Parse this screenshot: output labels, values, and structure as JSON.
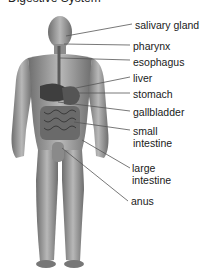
{
  "title": "Digestive System",
  "labels": [
    {
      "text": "salivary gland",
      "x": 135,
      "y": 19
    },
    {
      "text": "pharynx",
      "x": 133,
      "y": 40
    },
    {
      "text": "esophagus",
      "x": 133,
      "y": 56
    },
    {
      "text": "liver",
      "x": 133,
      "y": 73
    },
    {
      "text": "stomach",
      "x": 133,
      "y": 89
    },
    {
      "text": "gallbladder",
      "x": 133,
      "y": 107
    },
    {
      "text": "small",
      "x": 133,
      "y": 126
    },
    {
      "text": "intestine",
      "x": 133,
      "y": 138
    },
    {
      "text": "large",
      "x": 132,
      "y": 163
    },
    {
      "text": "intestine",
      "x": 132,
      "y": 175
    },
    {
      "text": "anus",
      "x": 131,
      "y": 196
    }
  ],
  "colors": {
    "skin": "#9a9a9a",
    "organ": "#4a4a4a",
    "line": "#555555"
  }
}
